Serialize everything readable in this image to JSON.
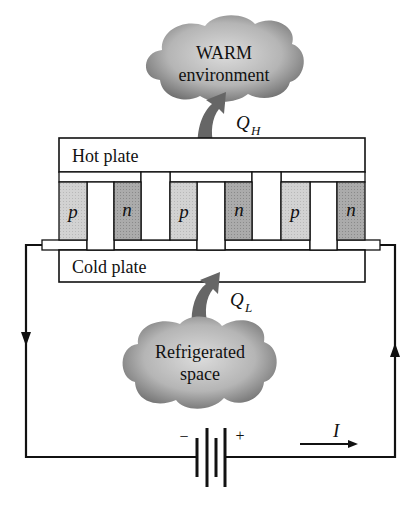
{
  "diagram": {
    "type": "thermoelectric-refrigerator",
    "warm_cloud": {
      "line1": "WARM",
      "line2": "environment"
    },
    "cold_cloud": {
      "line1": "Refrigerated",
      "line2": "space"
    },
    "heat_out": {
      "symbol": "Q",
      "subscript": "H"
    },
    "heat_in": {
      "symbol": "Q",
      "subscript": "L"
    },
    "hot_plate_label": "Hot plate",
    "cold_plate_label": "Cold plate",
    "elements": [
      {
        "type": "p"
      },
      {
        "type": "n"
      },
      {
        "type": "p"
      },
      {
        "type": "n"
      },
      {
        "type": "p"
      },
      {
        "type": "n"
      }
    ],
    "battery": {
      "minus": "−",
      "plus": "+"
    },
    "current": {
      "label": "I"
    },
    "colors": {
      "line": "#111111",
      "p_fill": "#cfcfcf",
      "n_fill": "#a9a9a9",
      "cloud_dark": "#6e6e6e",
      "cloud_light": "#d6d6d6",
      "arrow": "#666666"
    }
  }
}
